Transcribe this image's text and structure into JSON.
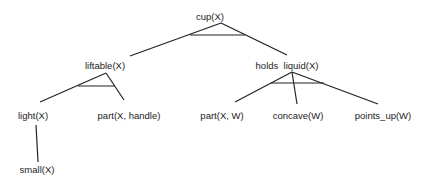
{
  "diagram": {
    "type": "and-tree",
    "nodes": [
      {
        "id": "cup",
        "label": "cup(X)",
        "x": 210,
        "y": 17
      },
      {
        "id": "liftable",
        "label": "liftable(X)",
        "x": 105,
        "y": 66
      },
      {
        "id": "holds_liquid",
        "label": "holds  liquid(X)",
        "x": 287,
        "y": 66
      },
      {
        "id": "light",
        "label": "light(X)",
        "x": 33,
        "y": 116
      },
      {
        "id": "part_handle",
        "label": "part(X, handle)",
        "x": 129,
        "y": 116
      },
      {
        "id": "part_w",
        "label": "part(X, W)",
        "x": 222,
        "y": 116
      },
      {
        "id": "concave",
        "label": "concave(W)",
        "x": 298,
        "y": 116
      },
      {
        "id": "points_up",
        "label": "points_up(W)",
        "x": 383,
        "y": 116
      },
      {
        "id": "small",
        "label": "small(X)",
        "x": 37,
        "y": 170
      }
    ],
    "edges": [
      {
        "from": "cup",
        "to": "liftable",
        "x1": 221,
        "y1": 23,
        "x2": 130,
        "y2": 56
      },
      {
        "from": "cup",
        "to": "holds_liquid",
        "x1": 221,
        "y1": 23,
        "x2": 287,
        "y2": 55
      },
      {
        "from": "liftable",
        "to": "light",
        "x1": 106,
        "y1": 73,
        "x2": 40,
        "y2": 102
      },
      {
        "from": "liftable",
        "to": "part_handle",
        "x1": 106,
        "y1": 73,
        "x2": 124,
        "y2": 100
      },
      {
        "from": "holds_liquid",
        "to": "part_w",
        "x1": 292,
        "y1": 72,
        "x2": 235,
        "y2": 102
      },
      {
        "from": "holds_liquid",
        "to": "concave",
        "x1": 292,
        "y1": 72,
        "x2": 297,
        "y2": 104
      },
      {
        "from": "holds_liquid",
        "to": "points_up",
        "x1": 292,
        "y1": 72,
        "x2": 378,
        "y2": 104
      },
      {
        "from": "light",
        "to": "small",
        "x1": 36,
        "y1": 125,
        "x2": 38,
        "y2": 162
      }
    ],
    "and_arcs": [
      {
        "node": "cup",
        "x1": 190,
        "y1": 35,
        "x2": 245,
        "y2": 35
      },
      {
        "node": "liftable",
        "x1": 78,
        "y1": 86,
        "x2": 115,
        "y2": 86
      },
      {
        "node": "holds_liquid",
        "x1": 271,
        "y1": 83,
        "x2": 324,
        "y2": 83
      }
    ],
    "colors": {
      "line": "#222222",
      "text": "#222222",
      "background": "#ffffff"
    }
  }
}
